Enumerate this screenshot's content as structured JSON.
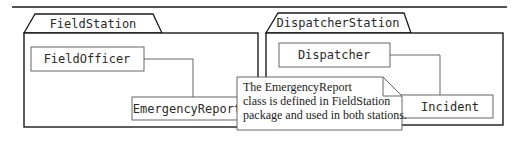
{
  "diagram": {
    "type": "UML package diagram",
    "packages": [
      {
        "name": "FieldStation",
        "classes": [
          "FieldOfficer",
          "EmergencyReport"
        ]
      },
      {
        "name": "DispatcherStation",
        "classes": [
          "Dispatcher",
          "Incident"
        ]
      }
    ],
    "associations": [
      {
        "from": "FieldOfficer",
        "to": "EmergencyReport"
      },
      {
        "from": "Dispatcher",
        "to": "Incident"
      }
    ],
    "note": {
      "lines": [
        "The EmergencyReport",
        "class is defined in FieldStation",
        "package and used in both stations."
      ]
    },
    "colors": {
      "line": "#1a1a1a",
      "thin_line": "#555555",
      "background": "#ffffff"
    }
  }
}
